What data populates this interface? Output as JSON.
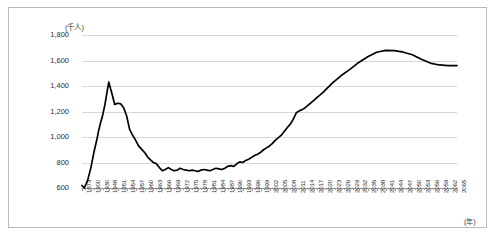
{
  "chart_data": {
    "type": "line",
    "title": "",
    "subtitle": "",
    "xlabel": "(年)",
    "ylabel": "(千人)",
    "unit_note": "(千人)",
    "ylim": [
      600,
      1800
    ],
    "y_ticks": [
      "600",
      "800",
      "1,000",
      "1,200",
      "1,400",
      "1,600",
      "1,800"
    ],
    "y_tick_values": [
      600,
      800,
      1000,
      1200,
      1400,
      1600,
      1800
    ],
    "grid": true,
    "legend": "none",
    "line_color": "#000000",
    "grid_color": "#d6d6d6",
    "border_color": "#b9b9b9",
    "x_tick_labels": [
      "1873",
      "1900",
      "1930",
      "1948",
      "1951",
      "1954",
      "1957",
      "1960",
      "1963",
      "1966",
      "1969",
      "1972",
      "1975",
      "1978",
      "1981",
      "1984",
      "1987",
      "1990",
      "1993",
      "1996",
      "1999",
      "2002",
      "2005",
      "2008",
      "2011",
      "2014",
      "2017",
      "2020",
      "2023",
      "2026",
      "2029",
      "2032",
      "2035",
      "2038",
      "2041",
      "2044",
      "2047",
      "2050",
      "2053",
      "2056",
      "2059",
      "2062",
      "2065"
    ],
    "series": [
      {
        "name": "人口",
        "x": [
          1873,
          1880,
          1890,
          1900,
          1910,
          1920,
          1925,
          1930,
          1935,
          1940,
          1944,
          1947,
          1948,
          1949,
          1950,
          1951,
          1952,
          1953,
          1954,
          1955,
          1956,
          1957,
          1958,
          1959,
          1960,
          1961,
          1962,
          1963,
          1964,
          1965,
          1966,
          1967,
          1968,
          1969,
          1970,
          1971,
          1972,
          1973,
          1974,
          1975,
          1976,
          1977,
          1978,
          1979,
          1980,
          1981,
          1982,
          1983,
          1984,
          1985,
          1986,
          1987,
          1988,
          1989,
          1990,
          1991,
          1992,
          1993,
          1994,
          1995,
          1996,
          1997,
          1998,
          1999,
          2000,
          2001,
          2002,
          2003,
          2004,
          2005,
          2006,
          2007,
          2008,
          2009,
          2010,
          2011,
          2012,
          2013,
          2014,
          2015,
          2016,
          2017,
          2018,
          2019,
          2020,
          2023,
          2026,
          2029,
          2032,
          2035,
          2038,
          2041,
          2044,
          2047,
          2050,
          2053,
          2056,
          2059,
          2062,
          2065
        ],
        "values": [
          620,
          600,
          660,
          760,
          880,
          980,
          1040,
          1090,
          1160,
          1250,
          1340,
          1410,
          1430,
          1345,
          1255,
          1265,
          1260,
          1230,
          1165,
          1060,
          1015,
          975,
          930,
          905,
          880,
          845,
          820,
          800,
          790,
          760,
          735,
          745,
          760,
          745,
          735,
          740,
          755,
          745,
          740,
          735,
          740,
          735,
          730,
          740,
          745,
          740,
          735,
          745,
          755,
          750,
          745,
          755,
          770,
          775,
          770,
          790,
          805,
          800,
          815,
          825,
          840,
          855,
          865,
          880,
          900,
          915,
          930,
          950,
          975,
          995,
          1015,
          1045,
          1075,
          1100,
          1140,
          1190,
          1205,
          1215,
          1230,
          1250,
          1270,
          1290,
          1310,
          1330,
          1350,
          1420,
          1480,
          1530,
          1585,
          1630,
          1665,
          1680,
          1678,
          1665,
          1645,
          1610,
          1580,
          1565,
          1560,
          1560
        ]
      }
    ]
  }
}
